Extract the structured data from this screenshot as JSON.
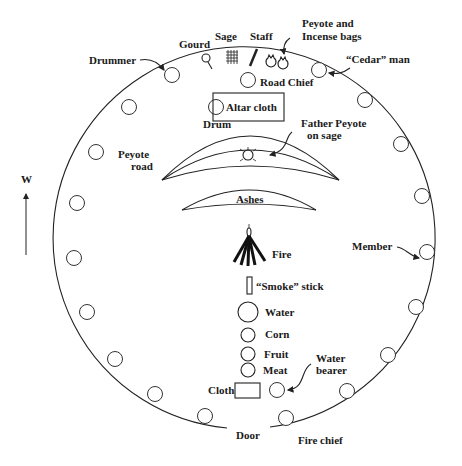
{
  "diagram": {
    "compass": {
      "label": "W",
      "direction": "up"
    },
    "colors": {
      "ink": "#222222",
      "background": "#ffffff"
    },
    "labels": {
      "drummer": "Drummer",
      "gourd": "Gourd",
      "sage": "Sage",
      "staff": "Staff",
      "peyote_bags_line1": "Peyote and",
      "peyote_bags_line2": "Incense bags",
      "cedar_man": "“Cedar” man",
      "road_chief": "Road Chief",
      "altar_cloth": "Altar cloth",
      "drum": "Drum",
      "father_peyote_line1": "Father Peyote",
      "father_peyote_line2": "on sage",
      "peyote_road_line1": "Peyote",
      "peyote_road_line2": "road",
      "ashes": "Ashes",
      "fire": "Fire",
      "smoke_stick": "“Smoke” stick",
      "water": "Water",
      "corn": "Corn",
      "fruit": "Fruit",
      "meat": "Meat",
      "water_bearer_line1": "Water",
      "water_bearer_line2": "bearer",
      "cloth": "Cloth",
      "member": "Member",
      "door": "Door",
      "fire_chief": "Fire chief"
    },
    "seat_count": 20
  }
}
